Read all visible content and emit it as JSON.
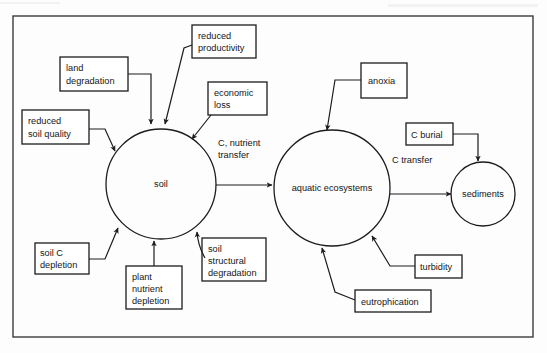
{
  "figure": {
    "border_color": "#3b3b3b",
    "line_color": "#1c1c1c",
    "background_color": "#fdfdfd"
  },
  "nodes": {
    "circles": [
      {
        "id": "soil",
        "label": "soil",
        "cx": 161,
        "cy": 184,
        "r": 55
      },
      {
        "id": "aquatic",
        "label": "aquatic ecosystems",
        "cx": 332,
        "cy": 188,
        "r": 58
      },
      {
        "id": "sediments",
        "label": "sediments",
        "cx": 483,
        "cy": 194,
        "r": 32
      }
    ],
    "boxes": [
      {
        "id": "reduced-productivity",
        "line1": "reduced",
        "line2": "productivity",
        "x": 192,
        "y": 25,
        "w": 64,
        "h": 33
      },
      {
        "id": "land-degradation",
        "line1": "land",
        "line2": "degradation",
        "x": 60,
        "y": 57,
        "w": 68,
        "h": 34
      },
      {
        "id": "economic-loss",
        "line1": "economic",
        "line2": "loss",
        "x": 208,
        "y": 82,
        "w": 59,
        "h": 33
      },
      {
        "id": "reduced-soil-quality",
        "line1": "reduced",
        "line2": "soil quality",
        "x": 22,
        "y": 110,
        "w": 67,
        "h": 34
      },
      {
        "id": "anoxia",
        "line1": "anoxia",
        "line2": "",
        "x": 361,
        "y": 63,
        "w": 46,
        "h": 35
      },
      {
        "id": "c-burial",
        "line1": "C burial",
        "line2": "",
        "x": 406,
        "y": 123,
        "w": 47,
        "h": 22
      },
      {
        "id": "soil-c-depletion",
        "line1": "soil C",
        "line2": "depletion",
        "x": 35,
        "y": 243,
        "w": 54,
        "h": 31
      },
      {
        "id": "plant-nutrient-depletion",
        "line1": "plant",
        "line2": "nutrient",
        "line3": "depletion",
        "x": 126,
        "y": 266,
        "w": 56,
        "h": 43
      },
      {
        "id": "soil-structural-degradation",
        "line1": "soil",
        "line2": "structural",
        "line3": "degradation",
        "x": 202,
        "y": 238,
        "w": 64,
        "h": 43
      },
      {
        "id": "turbidity",
        "line1": "turbidity",
        "line2": "",
        "x": 415,
        "y": 255,
        "w": 47,
        "h": 23
      },
      {
        "id": "eutrophication",
        "line1": "eutrophication",
        "line2": "",
        "x": 355,
        "y": 290,
        "w": 76,
        "h": 22
      }
    ]
  },
  "edge_labels": [
    {
      "id": "c-nutrient-transfer",
      "line1": "C, nutrient",
      "line2": "transfer",
      "x": 218,
      "y": 146
    },
    {
      "id": "c-transfer",
      "line1": "C transfer",
      "line2": "",
      "x": 392,
      "y": 163
    }
  ],
  "relationships": [
    {
      "from": "land-degradation",
      "to": "soil"
    },
    {
      "from": "reduced-productivity",
      "to": "soil"
    },
    {
      "from": "economic-loss",
      "to": "soil"
    },
    {
      "from": "reduced-soil-quality",
      "to": "soil"
    },
    {
      "from": "soil-c-depletion",
      "to": "soil"
    },
    {
      "from": "plant-nutrient-depletion",
      "to": "soil"
    },
    {
      "from": "soil-structural-degradation",
      "to": "soil"
    },
    {
      "from": "soil",
      "to": "aquatic",
      "label": "C, nutrient transfer"
    },
    {
      "from": "anoxia",
      "to": "aquatic"
    },
    {
      "from": "turbidity",
      "to": "aquatic"
    },
    {
      "from": "eutrophication",
      "to": "aquatic"
    },
    {
      "from": "aquatic",
      "to": "sediments",
      "label": "C transfer"
    },
    {
      "from": "c-burial",
      "to": "sediments"
    }
  ]
}
